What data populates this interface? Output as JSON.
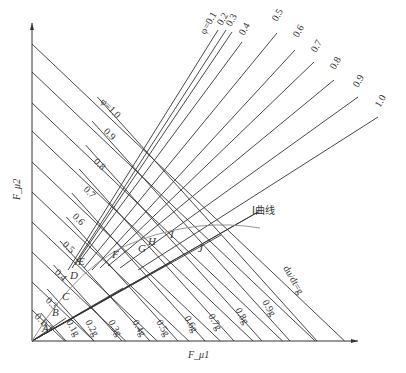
{
  "diagram": {
    "title": "",
    "axes": {
      "x_label": "F_μ1",
      "y_label": "F_μ2",
      "origin": [
        32,
        341
      ],
      "x_end": 358,
      "y_end": 23
    },
    "f_lines": {
      "description": "φ lines from F_μ2 axis",
      "labels": [
        "φ=1.0",
        "0.9",
        "0.8",
        "0.7",
        "0.6",
        "0.5",
        "0.4",
        "0.3",
        "0.2",
        "0.1"
      ],
      "y_intercepts": [
        44,
        72,
        103,
        131,
        162,
        192,
        222,
        252,
        282,
        310
      ]
    },
    "r_lines": {
      "description": "φ fan lines radiating to upper right",
      "labels": [
        "φ=0.1",
        "0.2",
        "0.3",
        "0.4",
        "0.5",
        "0.6",
        "0.7",
        "0.8",
        "0.9",
        "1.0"
      ]
    },
    "g_lines": {
      "description": "constant deceleration lines",
      "labels": [
        "0.1g",
        "0.2g",
        "0.3g",
        "0.4g",
        "0.5g",
        "0.6g",
        "0.7g",
        "0.8g",
        "0.9g",
        "du/dt=g"
      ],
      "x_intercepts": [
        66,
        94,
        122,
        150,
        178,
        205,
        234,
        262,
        290,
        317
      ]
    },
    "points": [
      "A",
      "B",
      "C",
      "D",
      "E",
      "F",
      "G",
      "H",
      "I",
      "J"
    ],
    "curve_label": "I曲线",
    "colors": {
      "line": "#333333",
      "curve": "#888888",
      "background": "#ffffff"
    }
  }
}
